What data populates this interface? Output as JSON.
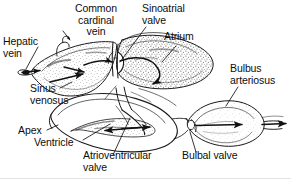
{
  "figure": {
    "kind": "anatomical-diagram",
    "style": "black-and-white stippled line drawing with leader lines",
    "width_px": 291,
    "height_px": 179,
    "background_color": "#ffffff",
    "ink_color": "#1a1a1a",
    "text_color": "#0d0d0d"
  },
  "labels": [
    {
      "id": "common-cardinal-vein",
      "text": "Common\ncardinal\nvein"
    },
    {
      "id": "sinoatrial-valve",
      "text": "Sinoatrial\nvalve"
    },
    {
      "id": "atrium",
      "text": "Atrium"
    },
    {
      "id": "hepatic-vein",
      "text": "Hepatic\nvein"
    },
    {
      "id": "bulbus-arteriosus",
      "text": "Bulbus\narteriosus"
    },
    {
      "id": "sinus-venosus",
      "text": "Sinus\nvenosus"
    },
    {
      "id": "apex",
      "text": "Apex"
    },
    {
      "id": "ventricle",
      "text": "Ventricle"
    },
    {
      "id": "atrioventricular-valve",
      "text": "Atrioventricular\nvalve"
    },
    {
      "id": "bulbal-valve",
      "text": "Bulbal valve"
    }
  ],
  "structures": [
    "sinus venosus",
    "atrium",
    "ventricle",
    "bulbus arteriosus",
    "sinoatrial valve",
    "atrioventricular valve",
    "bulbal valve",
    "hepatic vein",
    "common cardinal vein",
    "apex"
  ],
  "flow_arrows": {
    "count": 7,
    "description": "Arrows trace blood flow from hepatic vein and common cardinal vein into the sinus venosus, through the sinoatrial valve into the atrium, down through the atrioventricular valve into the ventricle, then out through the bulbal valve into the bulbus arteriosus and ventral aorta."
  }
}
